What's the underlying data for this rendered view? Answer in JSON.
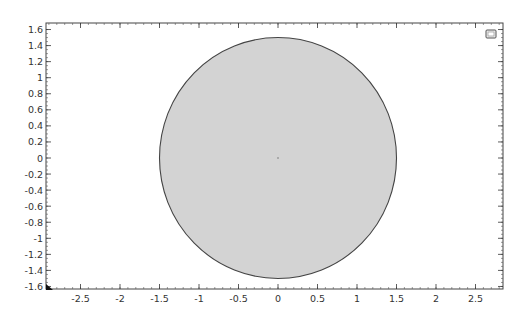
{
  "view": {
    "x_axis": {
      "min": -2.9,
      "max": 2.85,
      "ticks": [
        -2.5,
        -2,
        -1.5,
        -1,
        -0.5,
        0,
        0.5,
        1,
        1.5,
        2,
        2.5
      ],
      "labels": [
        "-2.5",
        "-2",
        "-1.5",
        "-1",
        "-0.5",
        "0",
        "0.5",
        "1",
        "1.5",
        "2",
        "2.5"
      ]
    },
    "y_axis": {
      "min": -1.6,
      "max": 1.65,
      "ticks": [
        1.6,
        1.4,
        1.2,
        1,
        0.8,
        0.6,
        0.4,
        0.2,
        0,
        -0.2,
        -0.4,
        -0.6,
        -0.8,
        -1,
        -1.2,
        -1.4,
        -1.6
      ],
      "labels": [
        "1.6",
        "1.4",
        "1.2",
        "1",
        "0.8",
        "0.6",
        "0.4",
        "0.2",
        "0",
        "-0.2",
        "-0.4",
        "-0.6",
        "-0.8",
        "-1",
        "-1.2",
        "-1.4",
        "-1.6"
      ]
    }
  },
  "geometry": {
    "shape": "circle",
    "center": [
      0,
      0
    ],
    "radius": 1.5,
    "fill": "#d3d3d3",
    "stroke": "#444444"
  },
  "icons": {
    "restore_view": "window-restore-icon",
    "axis_triad": "axis-origin-triad-icon"
  }
}
